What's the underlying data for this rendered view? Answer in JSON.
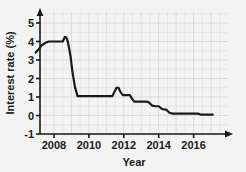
{
  "chart_data": {
    "type": "line",
    "title": "",
    "subtitle": "",
    "xlabel": "Year",
    "ylabel": "Interest rate (%)",
    "xlim": [
      2006.8,
      2017.2
    ],
    "ylim": [
      -1,
      5.6
    ],
    "xticks": [
      2008,
      2010,
      2012,
      2014,
      2016
    ],
    "xticklabels": [
      "2008",
      "2010",
      "2012",
      "2014",
      "2016"
    ],
    "yticks": [
      -1,
      0,
      1,
      2,
      3,
      4,
      5
    ],
    "yticklabels": [
      "-1",
      "0",
      "1",
      "2",
      "3",
      "4",
      "5"
    ],
    "grid": true,
    "grid_color": "#d8d8d8",
    "legend": null,
    "line_color": "#1a1a1a",
    "line_width": 2.2,
    "annotations": [],
    "series": [
      {
        "name": "Interest rate",
        "x": [
          2006.95,
          2007.1,
          2007.3,
          2007.55,
          2007.7,
          2008.25,
          2008.5,
          2008.62,
          2008.72,
          2008.8,
          2008.95,
          2009.05,
          2009.2,
          2009.35,
          2010.9,
          2011.05,
          2011.35,
          2011.45,
          2011.58,
          2011.7,
          2011.82,
          2011.95,
          2012.05,
          2012.2,
          2012.35,
          2012.48,
          2012.6,
          2012.95,
          2013.1,
          2013.3,
          2013.45,
          2013.6,
          2013.8,
          2014.0,
          2014.2,
          2014.45,
          2014.62,
          2014.8,
          2016.25,
          2016.4,
          2017.1
        ],
        "y": [
          3.4,
          3.55,
          3.8,
          3.95,
          4.0,
          4.0,
          4.0,
          4.25,
          4.2,
          3.95,
          3.2,
          2.4,
          1.55,
          1.05,
          1.05,
          1.05,
          1.05,
          1.25,
          1.5,
          1.5,
          1.25,
          1.1,
          1.1,
          1.1,
          1.1,
          0.9,
          0.75,
          0.75,
          0.75,
          0.75,
          0.7,
          0.55,
          0.5,
          0.5,
          0.35,
          0.3,
          0.15,
          0.1,
          0.1,
          0.05,
          0.05
        ]
      }
    ]
  },
  "axes": {
    "x_axis_name": "Year",
    "y_axis_name": "Interest rate (%)"
  }
}
